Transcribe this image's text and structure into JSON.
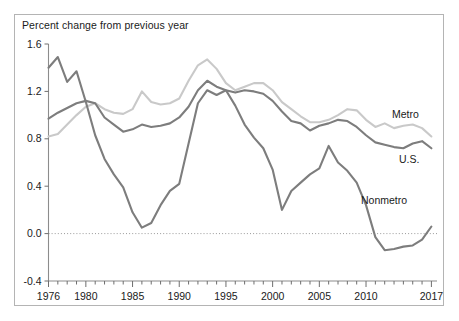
{
  "chart_data": {
    "type": "line",
    "title": "Percent change from previous year",
    "xlabel": "",
    "ylabel": "",
    "xlim": [
      1976,
      2017.6
    ],
    "ylim": [
      -0.4,
      1.6
    ],
    "grid": false,
    "legend_position": "inline-right",
    "zero_reference_line": true,
    "y_ticks": [
      "1.6",
      "1.2",
      "0.8",
      "0.4",
      "0.0",
      "-0.4"
    ],
    "y_tick_values": [
      1.6,
      1.2,
      0.8,
      0.4,
      0.0,
      -0.4
    ],
    "x_ticks": [
      "1976",
      "1980",
      "1985",
      "1990",
      "1995",
      "2000",
      "2005",
      "2010",
      "2017"
    ],
    "x_tick_values": [
      1976,
      1980,
      1985,
      1990,
      1995,
      2000,
      2005,
      2010,
      2017
    ],
    "x": [
      1976,
      1977,
      1978,
      1979,
      1980,
      1981,
      1982,
      1983,
      1984,
      1985,
      1986,
      1987,
      1988,
      1989,
      1990,
      1991,
      1992,
      1993,
      1994,
      1995,
      1996,
      1997,
      1998,
      1999,
      2000,
      2001,
      2002,
      2003,
      2004,
      2005,
      2006,
      2007,
      2008,
      2009,
      2010,
      2011,
      2012,
      2013,
      2014,
      2015,
      2016,
      2017
    ],
    "series": [
      {
        "name": "Metro",
        "color": "#c9c9c9",
        "values": [
          0.82,
          0.84,
          0.92,
          1.0,
          1.07,
          1.1,
          1.05,
          1.02,
          1.01,
          1.05,
          1.2,
          1.11,
          1.09,
          1.1,
          1.14,
          1.29,
          1.42,
          1.47,
          1.39,
          1.27,
          1.21,
          1.24,
          1.27,
          1.27,
          1.21,
          1.11,
          1.05,
          0.99,
          0.94,
          0.94,
          0.96,
          1.0,
          1.05,
          1.04,
          0.96,
          0.9,
          0.93,
          0.89,
          0.91,
          0.92,
          0.89,
          0.82
        ]
      },
      {
        "name": "U.S.",
        "color": "#7d7d7d",
        "values": [
          0.97,
          1.02,
          1.06,
          1.1,
          1.12,
          1.1,
          0.98,
          0.92,
          0.86,
          0.88,
          0.92,
          0.9,
          0.91,
          0.93,
          0.98,
          1.07,
          1.21,
          1.29,
          1.24,
          1.21,
          1.19,
          1.21,
          1.2,
          1.18,
          1.12,
          1.03,
          0.95,
          0.93,
          0.87,
          0.91,
          0.93,
          0.96,
          0.95,
          0.9,
          0.83,
          0.77,
          0.75,
          0.73,
          0.72,
          0.76,
          0.78,
          0.72
        ]
      },
      {
        "name": "Nonmetro",
        "color": "#7d7d7d",
        "values": [
          1.4,
          1.49,
          1.28,
          1.37,
          1.11,
          0.83,
          0.63,
          0.5,
          0.39,
          0.18,
          0.05,
          0.09,
          0.24,
          0.36,
          0.42,
          0.76,
          1.1,
          1.21,
          1.17,
          1.21,
          1.08,
          0.92,
          0.81,
          0.72,
          0.54,
          0.2,
          0.36,
          0.43,
          0.5,
          0.55,
          0.74,
          0.6,
          0.53,
          0.43,
          0.24,
          -0.03,
          -0.14,
          -0.13,
          -0.11,
          -0.1,
          -0.05,
          0.06
        ]
      }
    ]
  }
}
